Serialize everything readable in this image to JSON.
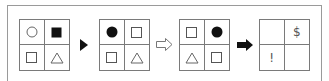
{
  "panels": [
    {
      "cells": [
        {
          "shape": "circle-outline"
        },
        {
          "shape": "square-filled"
        },
        {
          "shape": "square-outline"
        },
        {
          "shape": "triangle-outline"
        }
      ]
    },
    {
      "cells": [
        {
          "shape": "circle-filled"
        },
        {
          "shape": "square-outline"
        },
        {
          "shape": "square-outline"
        },
        {
          "shape": "triangle-outline"
        }
      ]
    },
    {
      "cells": [
        {
          "shape": "square-outline"
        },
        {
          "shape": "circle-filled"
        },
        {
          "shape": "triangle-outline"
        },
        {
          "shape": "square-outline"
        }
      ]
    },
    {
      "cells": [
        {
          "shape": "empty",
          "text": ""
        },
        {
          "shape": "text",
          "text": "$"
        },
        {
          "shape": "text",
          "text": "!"
        },
        {
          "shape": "empty",
          "text": ""
        }
      ]
    }
  ],
  "arrows": [
    {
      "type": "solid-triangle",
      "icon": "play-triangle-icon"
    },
    {
      "type": "outline-arrow",
      "icon": "hollow-arrow-icon"
    },
    {
      "type": "solid-block-arrow",
      "icon": "block-arrow-icon"
    }
  ],
  "colors": {
    "line": "#7a7a7a",
    "fill": "#111111",
    "frame": "#9a9a9a"
  }
}
